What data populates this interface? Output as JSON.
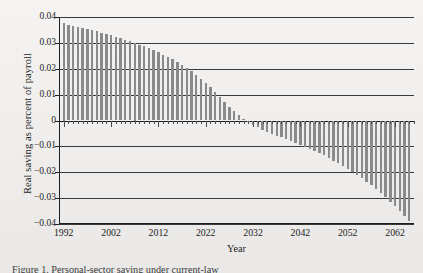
{
  "figure": {
    "caption": "Figure 1.  Personal-sector saving under current-law",
    "paper_color": "#f2f1ef"
  },
  "chart_data": {
    "type": "bar",
    "title": "",
    "xlabel": "Year",
    "ylabel": "Real saving as percent of payroll",
    "xlim": [
      1991.0,
      2066.0
    ],
    "ylim": [
      -0.04,
      0.04
    ],
    "grid": true,
    "legend": "none",
    "bar_color": "#8a8a8a",
    "yticks": [
      0.04,
      0.03,
      0.02,
      0.01,
      0,
      -0.01,
      -0.02,
      -0.03,
      -0.04
    ],
    "ytick_labels": [
      "0.04",
      "0.03",
      "0.02",
      "0.01",
      "0",
      "−0.01",
      "−0.02",
      "−0.03",
      "−0.04"
    ],
    "xticks": [
      1992,
      2002,
      2012,
      2022,
      2032,
      2042,
      2052,
      2062
    ],
    "xtick_labels": [
      "1992",
      "2002",
      "2012",
      "2022",
      "2032",
      "2042",
      "2052",
      "2062"
    ],
    "x": [
      1992,
      1993,
      1994,
      1995,
      1996,
      1997,
      1998,
      1999,
      2000,
      2001,
      2002,
      2003,
      2004,
      2005,
      2006,
      2007,
      2008,
      2009,
      2010,
      2011,
      2012,
      2013,
      2014,
      2015,
      2016,
      2017,
      2018,
      2019,
      2020,
      2021,
      2022,
      2023,
      2024,
      2025,
      2026,
      2027,
      2028,
      2029,
      2030,
      2031,
      2032,
      2033,
      2034,
      2035,
      2036,
      2037,
      2038,
      2039,
      2040,
      2041,
      2042,
      2043,
      2044,
      2045,
      2046,
      2047,
      2048,
      2049,
      2050,
      2051,
      2052,
      2053,
      2054,
      2055,
      2056,
      2057,
      2058,
      2059,
      2060,
      2061,
      2062,
      2063,
      2064,
      2065
    ],
    "values": [
      0.0375,
      0.037,
      0.0366,
      0.0362,
      0.0358,
      0.0354,
      0.035,
      0.0345,
      0.034,
      0.0335,
      0.033,
      0.0324,
      0.0318,
      0.0312,
      0.0306,
      0.03,
      0.0293,
      0.0286,
      0.0279,
      0.0271,
      0.0263,
      0.0254,
      0.0245,
      0.0236,
      0.0226,
      0.0215,
      0.0203,
      0.019,
      0.0176,
      0.0161,
      0.0145,
      0.0128,
      0.011,
      0.0091,
      0.0072,
      0.0054,
      0.0037,
      0.0021,
      0.0007,
      -0.0005,
      -0.0016,
      -0.0026,
      -0.0035,
      -0.0043,
      -0.0051,
      -0.0058,
      -0.0065,
      -0.0072,
      -0.0079,
      -0.0086,
      -0.0093,
      -0.0101,
      -0.0109,
      -0.0117,
      -0.0126,
      -0.0135,
      -0.0145,
      -0.0155,
      -0.0165,
      -0.0176,
      -0.0187,
      -0.0199,
      -0.0211,
      -0.0224,
      -0.0237,
      -0.0251,
      -0.0266,
      -0.0281,
      -0.0297,
      -0.0314,
      -0.0331,
      -0.0349,
      -0.0368,
      -0.0388
    ]
  }
}
